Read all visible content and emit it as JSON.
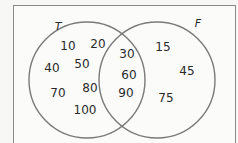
{
  "diagram": {
    "type": "venn",
    "sets": [
      {
        "label": "T",
        "only": [
          "10",
          "20",
          "40",
          "50",
          "70",
          "80",
          "100"
        ]
      },
      {
        "label": "F",
        "only": [
          "15",
          "45",
          "75"
        ]
      }
    ],
    "intersection": [
      "30",
      "60",
      "90"
    ],
    "colors": {
      "circle_stroke": "#7a7a7a",
      "frame_stroke": "#8a8a8a",
      "background": "#fbfbfa",
      "text": "#2a2a2a"
    }
  }
}
